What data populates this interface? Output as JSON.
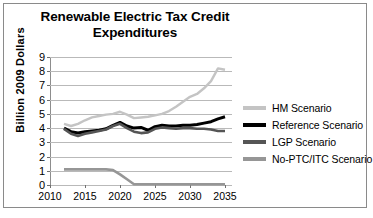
{
  "chart_data": {
    "type": "line",
    "title": "Renewable Electric Tax Credit Expenditures",
    "title_lines": [
      "Renewable Electric Tax Credit",
      "Expenditures"
    ],
    "xlabel": "",
    "ylabel": "Billion 2009 Dollars",
    "xlim": [
      2010,
      2036
    ],
    "ylim": [
      0,
      9
    ],
    "ytick_labels": [
      "0",
      "1",
      "2",
      "3",
      "4",
      "5",
      "6",
      "7",
      "8",
      "9"
    ],
    "ytick_values": [
      0,
      1,
      2,
      3,
      4,
      5,
      6,
      7,
      8,
      9
    ],
    "xtick_labels": [
      "2010",
      "2015",
      "2020",
      "2025",
      "2030",
      "2035"
    ],
    "xtick_values": [
      2010,
      2015,
      2020,
      2025,
      2030,
      2035
    ],
    "grid": "horizontal",
    "legend_position": "right",
    "x": [
      2012,
      2013,
      2014,
      2015,
      2016,
      2017,
      2018,
      2019,
      2020,
      2021,
      2022,
      2023,
      2024,
      2025,
      2026,
      2027,
      2028,
      2029,
      2030,
      2031,
      2032,
      2033,
      2034,
      2035
    ],
    "series": [
      {
        "name": "HM Scenario",
        "color": "#c4c4c4",
        "values": [
          4.3,
          4.15,
          4.3,
          4.55,
          4.75,
          4.85,
          4.95,
          5.0,
          5.15,
          4.95,
          4.7,
          4.75,
          4.8,
          4.9,
          5.0,
          5.2,
          5.5,
          5.85,
          6.2,
          6.4,
          6.8,
          7.3,
          8.2,
          8.1
        ]
      },
      {
        "name": "Reference Scenario",
        "color": "#000000",
        "values": [
          4.0,
          3.75,
          3.65,
          3.75,
          3.8,
          3.85,
          3.95,
          4.2,
          4.4,
          4.15,
          4.0,
          4.05,
          3.85,
          4.1,
          4.2,
          4.15,
          4.15,
          4.2,
          4.2,
          4.25,
          4.35,
          4.45,
          4.65,
          4.8
        ]
      },
      {
        "name": "LGP Scenario",
        "color": "#555555",
        "values": [
          3.95,
          3.6,
          3.45,
          3.6,
          3.7,
          3.8,
          3.9,
          4.15,
          4.3,
          4.0,
          3.75,
          3.65,
          3.7,
          3.95,
          4.05,
          4.0,
          3.95,
          4.0,
          4.0,
          3.95,
          3.95,
          3.9,
          3.8,
          3.8
        ]
      },
      {
        "name": "No-PTC/ITC Scenario",
        "color": "#969696",
        "values": [
          1.1,
          1.1,
          1.1,
          1.1,
          1.1,
          1.1,
          1.1,
          1.05,
          0.75,
          0.4,
          0.05,
          0.05,
          0.05,
          0.05,
          0.05,
          0.05,
          0.05,
          0.05,
          0.05,
          0.05,
          0.05,
          0.05,
          0.05,
          0.05
        ]
      }
    ]
  },
  "legend": {
    "items": [
      {
        "label": "HM Scenario",
        "color": "#c4c4c4"
      },
      {
        "label": "Reference Scenario",
        "color": "#000000"
      },
      {
        "label": "LGP Scenario",
        "color": "#555555"
      },
      {
        "label": "No-PTC/ITC Scenario",
        "color": "#969696"
      }
    ]
  },
  "colors": {
    "background": "#ffffff",
    "border": "#8a8a8a",
    "gridline": "#b9b9b9",
    "axis": "#8d8d8d",
    "text": "#000000"
  }
}
